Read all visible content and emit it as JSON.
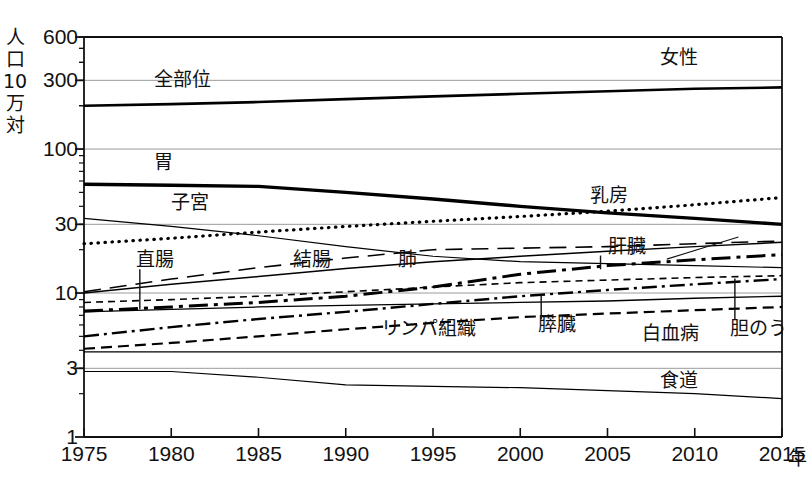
{
  "figure": {
    "panel_label": "女性",
    "y_axis_title_chars": [
      "人",
      "口",
      "10",
      "万",
      "対"
    ],
    "x_axis_unit": "年"
  },
  "chart_data": {
    "type": "line",
    "title": "女性",
    "subtitle": "",
    "xlabel": "年",
    "ylabel": "人口10万対",
    "scale": "log",
    "grid": true,
    "legend_position": "inline-labels",
    "x": [
      1975,
      1980,
      1985,
      1990,
      1995,
      2000,
      2005,
      2010,
      2015
    ],
    "xlim": [
      1975,
      2015
    ],
    "xticks": [
      "1975",
      "1980",
      "1985",
      "1990",
      "1995",
      "2000",
      "2005",
      "2010",
      "2015"
    ],
    "ylim": [
      1,
      600
    ],
    "yticks": [
      "600",
      "300",
      "100",
      "30",
      "10",
      "3",
      "1"
    ],
    "ytick_values": [
      600,
      300,
      100,
      30,
      10,
      3,
      1
    ],
    "series": [
      {
        "name": "全部位",
        "label": "全部位",
        "style": "solid",
        "width": 2.6,
        "values": [
          200,
          205,
          212,
          222,
          232,
          242,
          252,
          262,
          268
        ]
      },
      {
        "name": "胃",
        "label": "胃",
        "style": "solid",
        "width": 3.4,
        "values": [
          57,
          56,
          55,
          50,
          45,
          40,
          36,
          33,
          30
        ]
      },
      {
        "name": "子宮",
        "label": "子宮",
        "style": "solid",
        "width": 1.2,
        "values": [
          33,
          29,
          25,
          21,
          18,
          16.5,
          16,
          15.5,
          15
        ]
      },
      {
        "name": "乳房",
        "label": "乳房",
        "style": "dotted",
        "width": 3.2,
        "values": [
          22,
          24,
          26.5,
          29,
          31.5,
          34,
          37,
          41,
          46
        ]
      },
      {
        "name": "結腸",
        "label": "結腸",
        "style": "longdash",
        "width": 1.6,
        "values": [
          10.2,
          12.5,
          15,
          17.5,
          20,
          20.5,
          21,
          22,
          23
        ]
      },
      {
        "name": "直腸",
        "label": "直腸",
        "style": "solid",
        "width": 1.3,
        "values": [
          7.4,
          7.7,
          8,
          8.2,
          8.4,
          8.6,
          8.8,
          9.2,
          9.5
        ]
      },
      {
        "name": "肺",
        "label": "肺",
        "style": "solid",
        "width": 1.5,
        "values": [
          10.0,
          11.5,
          13,
          14.8,
          16.5,
          18,
          19.5,
          21,
          22.5
        ]
      },
      {
        "name": "肝臓",
        "label": "肝臓",
        "style": "dashdot-heavy",
        "width": 3.0,
        "values": [
          7.5,
          8.0,
          8.6,
          9.5,
          11,
          13.5,
          15.5,
          17,
          18.5
        ]
      },
      {
        "name": "膵臓",
        "label": "膵臓",
        "style": "dashdot",
        "width": 2.4,
        "values": [
          5.0,
          5.8,
          6.6,
          7.4,
          8.4,
          9.5,
          10.5,
          11.5,
          12.5
        ]
      },
      {
        "name": "リンパ組織",
        "label": "リンパ組織",
        "style": "dashed",
        "width": 2.2,
        "values": [
          4.1,
          4.5,
          5.0,
          5.6,
          6.2,
          6.8,
          7.2,
          7.6,
          8.0
        ]
      },
      {
        "name": "胆のう",
        "label": "胆のう",
        "style": "dashed-fine",
        "width": 1.6,
        "values": [
          8.6,
          9.0,
          9.5,
          10.2,
          11.0,
          11.8,
          12.3,
          12.8,
          13.2
        ]
      },
      {
        "name": "白血病",
        "label": "白血病",
        "style": "solid",
        "width": 1.2,
        "values": [
          3.9,
          3.9,
          3.9,
          3.9,
          3.9,
          3.9,
          3.9,
          3.9,
          3.9
        ]
      },
      {
        "name": "食道",
        "label": "食道",
        "style": "solid",
        "width": 1.2,
        "values": [
          2.85,
          2.85,
          2.6,
          2.3,
          2.25,
          2.2,
          2.1,
          2.0,
          1.85
        ]
      }
    ],
    "annotations": [
      {
        "text": "女性",
        "x": 2008,
        "y": 430
      },
      {
        "text": "全部位",
        "x": 1979,
        "y": 300
      },
      {
        "text": "胃",
        "x": 1979,
        "y": 80
      },
      {
        "text": "子宮",
        "x": 1980,
        "y": 42
      },
      {
        "text": "乳房",
        "x": 2004,
        "y": 47
      },
      {
        "text": "結腸",
        "x": 1987,
        "y": 17
      },
      {
        "text": "直腸",
        "x": 1978,
        "y": 17
      },
      {
        "text": "肺",
        "x": 1993,
        "y": 17
      },
      {
        "text": "肝臓",
        "x": 2005,
        "y": 21
      },
      {
        "text": "膵臓",
        "x": 2001,
        "y": 6.0
      },
      {
        "text": "リンパ組織",
        "x": 1992,
        "y": 5.6
      },
      {
        "text": "胆のう",
        "x": 2012,
        "y": 5.6
      },
      {
        "text": "白血病",
        "x": 2007,
        "y": 5.2
      },
      {
        "text": "食道",
        "x": 2008,
        "y": 2.45
      }
    ]
  }
}
